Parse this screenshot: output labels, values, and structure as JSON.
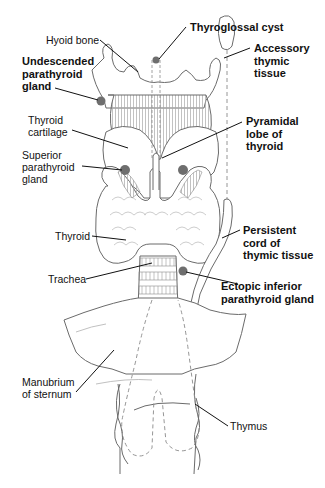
{
  "figure": {
    "colors": {
      "outline": "#6b6b6b",
      "hatch": "#9a9a9a",
      "gland": "#6e6e6e",
      "leader": "#111111",
      "text": "#111111"
    }
  },
  "labels": {
    "hyoid_bone": {
      "lines": [
        "Hyoid bone"
      ],
      "bold": false
    },
    "undescended_parathyroid": {
      "lines": [
        "Undescended",
        "parathyroid",
        "gland"
      ],
      "bold": true
    },
    "thyroid_cartilage": {
      "lines": [
        "Thyroid",
        "cartilage"
      ],
      "bold": false
    },
    "superior_parathyroid": {
      "lines": [
        "Superior",
        "parathyroid",
        "gland"
      ],
      "bold": false
    },
    "thyroid": {
      "lines": [
        "Thyroid"
      ],
      "bold": false
    },
    "trachea": {
      "lines": [
        "Trachea"
      ],
      "bold": false
    },
    "manubrium": {
      "lines": [
        "Manubrium",
        "of sternum"
      ],
      "bold": false
    },
    "thyroglossal_cyst": {
      "lines": [
        "Thyroglossal cyst"
      ],
      "bold": true
    },
    "accessory_thymic": {
      "lines": [
        "Accessory",
        "thymic",
        "tissue"
      ],
      "bold": true
    },
    "pyramidal_lobe": {
      "lines": [
        "Pyramidal",
        "lobe of",
        "thyroid"
      ],
      "bold": true
    },
    "persistent_cord": {
      "lines": [
        "Persistent",
        "cord of",
        "thymic tissue"
      ],
      "bold": true
    },
    "ectopic_inferior": {
      "lines": [
        "Ectopic inferior",
        "parathyroid gland"
      ],
      "bold": true
    },
    "thymus": {
      "lines": [
        "Thymus"
      ],
      "bold": false
    }
  }
}
